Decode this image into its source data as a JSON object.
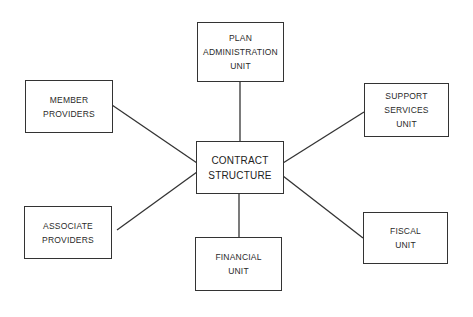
{
  "diagram": {
    "center": {
      "lines": [
        "CONTRACT",
        "STRUCTURE"
      ]
    },
    "nodes": {
      "plan_admin": {
        "lines": [
          "PLAN",
          "ADMINISTRATION",
          "UNIT"
        ]
      },
      "member_providers": {
        "lines": [
          "MEMBER",
          "PROVIDERS"
        ]
      },
      "support_services": {
        "lines": [
          "SUPPORT",
          "SERVICES",
          "UNIT"
        ]
      },
      "associate_providers": {
        "lines": [
          "ASSOCIATE",
          "PROVIDERS"
        ]
      },
      "financial_unit": {
        "lines": [
          "FINANCIAL",
          "UNIT"
        ]
      },
      "fiscal_unit": {
        "lines": [
          "FISCAL",
          "UNIT"
        ]
      }
    },
    "edges": [
      [
        "CONTRACT STRUCTURE",
        "PLAN ADMINISTRATION UNIT"
      ],
      [
        "CONTRACT STRUCTURE",
        "MEMBER PROVIDERS"
      ],
      [
        "CONTRACT STRUCTURE",
        "SUPPORT SERVICES UNIT"
      ],
      [
        "CONTRACT STRUCTURE",
        "ASSOCIATE PROVIDERS"
      ],
      [
        "CONTRACT STRUCTURE",
        "FINANCIAL UNIT"
      ],
      [
        "CONTRACT STRUCTURE",
        "FISCAL UNIT"
      ]
    ],
    "colors": {
      "line": "#333333",
      "text": "#2a2a2a",
      "background": "#ffffff"
    }
  }
}
